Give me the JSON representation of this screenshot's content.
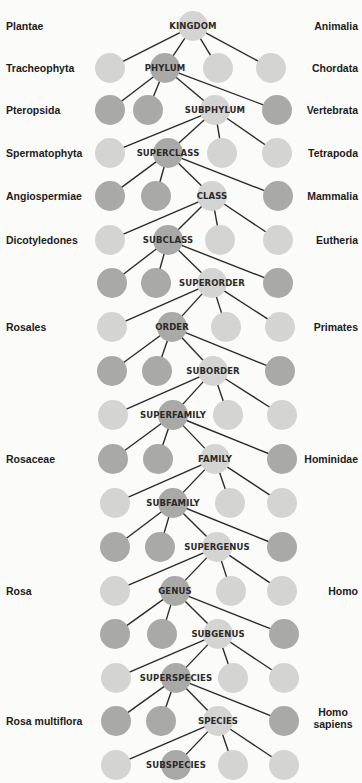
{
  "colors": {
    "background": "#fbfbf9",
    "light_node": "#d4d4d2",
    "dark_node": "#a9a9a7",
    "edge": "#2b2b2b",
    "text": "#1c1c1c"
  },
  "ranks": [
    {
      "label": "KINGDOM",
      "plant": "Plantae",
      "animal": "Animalia"
    },
    {
      "label": "PHYLUM",
      "plant": "Tracheophyta",
      "animal": "Chordata"
    },
    {
      "label": "SUBPHYLUM",
      "plant": "Pteropsida",
      "animal": "Vertebrata"
    },
    {
      "label": "SUPERCLASS",
      "plant": "Spermatophyta",
      "animal": "Tetrapoda"
    },
    {
      "label": "CLASS",
      "plant": "Angiospermiae",
      "animal": "Mammalia"
    },
    {
      "label": "SUBCLASS",
      "plant": "Dicotyledones",
      "animal": "Eutheria"
    },
    {
      "label": "SUPERORDER",
      "plant": "",
      "animal": ""
    },
    {
      "label": "ORDER",
      "plant": "Rosales",
      "animal": "Primates"
    },
    {
      "label": "SUBORDER",
      "plant": "",
      "animal": ""
    },
    {
      "label": "SUPERFAMILY",
      "plant": "",
      "animal": ""
    },
    {
      "label": "FAMILY",
      "plant": "Rosaceae",
      "animal": "Hominidae"
    },
    {
      "label": "SUBFAMILY",
      "plant": "",
      "animal": ""
    },
    {
      "label": "SUPERGENUS",
      "plant": "",
      "animal": ""
    },
    {
      "label": "GENUS",
      "plant": "Rosa",
      "animal": "Homo"
    },
    {
      "label": "SUBGENUS",
      "plant": "",
      "animal": ""
    },
    {
      "label": "SUPERSPECIES",
      "plant": "",
      "animal": ""
    },
    {
      "label": "SPECIES",
      "plant": "Rosa multiflora",
      "animal": "Homo sapiens"
    },
    {
      "label": "SUBSPECIES",
      "plant": "",
      "animal": ""
    }
  ],
  "rows": [
    {
      "y": 26,
      "nodes": [
        {
          "x": 193,
          "shade": "light",
          "rank": true
        }
      ]
    },
    {
      "y": 68,
      "nodes": [
        {
          "x": 110,
          "shade": "light"
        },
        {
          "x": 165,
          "shade": "dark",
          "rank": true
        },
        {
          "x": 218,
          "shade": "light"
        },
        {
          "x": 271,
          "shade": "light"
        }
      ]
    },
    {
      "y": 110,
      "nodes": [
        {
          "x": 110,
          "shade": "dark"
        },
        {
          "x": 148,
          "shade": "dark"
        },
        {
          "x": 215,
          "shade": "light",
          "rank": true
        },
        {
          "x": 277,
          "shade": "dark"
        }
      ]
    },
    {
      "y": 153,
      "nodes": [
        {
          "x": 110,
          "shade": "light"
        },
        {
          "x": 168,
          "shade": "dark",
          "rank": true
        },
        {
          "x": 222,
          "shade": "light"
        },
        {
          "x": 277,
          "shade": "light"
        }
      ]
    },
    {
      "y": 196,
      "nodes": [
        {
          "x": 110,
          "shade": "dark"
        },
        {
          "x": 156,
          "shade": "dark"
        },
        {
          "x": 212,
          "shade": "light",
          "rank": true
        },
        {
          "x": 278,
          "shade": "dark"
        }
      ]
    },
    {
      "y": 240,
      "nodes": [
        {
          "x": 110,
          "shade": "light"
        },
        {
          "x": 168,
          "shade": "dark",
          "rank": true
        },
        {
          "x": 220,
          "shade": "light"
        },
        {
          "x": 278,
          "shade": "light"
        }
      ]
    },
    {
      "y": 283,
      "nodes": [
        {
          "x": 112,
          "shade": "dark"
        },
        {
          "x": 156,
          "shade": "dark"
        },
        {
          "x": 212,
          "shade": "light",
          "rank": true
        },
        {
          "x": 278,
          "shade": "dark"
        }
      ]
    },
    {
      "y": 327,
      "nodes": [
        {
          "x": 112,
          "shade": "light"
        },
        {
          "x": 172,
          "shade": "dark",
          "rank": true
        },
        {
          "x": 226,
          "shade": "light"
        },
        {
          "x": 280,
          "shade": "light"
        }
      ]
    },
    {
      "y": 371,
      "nodes": [
        {
          "x": 112,
          "shade": "dark"
        },
        {
          "x": 157,
          "shade": "dark"
        },
        {
          "x": 213,
          "shade": "light",
          "rank": true
        },
        {
          "x": 280,
          "shade": "dark"
        }
      ]
    },
    {
      "y": 415,
      "nodes": [
        {
          "x": 113,
          "shade": "light"
        },
        {
          "x": 173,
          "shade": "dark",
          "rank": true
        },
        {
          "x": 228,
          "shade": "light"
        },
        {
          "x": 282,
          "shade": "light"
        }
      ]
    },
    {
      "y": 459,
      "nodes": [
        {
          "x": 113,
          "shade": "dark"
        },
        {
          "x": 158,
          "shade": "dark"
        },
        {
          "x": 215,
          "shade": "light",
          "rank": true
        },
        {
          "x": 282,
          "shade": "dark"
        }
      ]
    },
    {
      "y": 503,
      "nodes": [
        {
          "x": 115,
          "shade": "light"
        },
        {
          "x": 173,
          "shade": "dark",
          "rank": true
        },
        {
          "x": 230,
          "shade": "light"
        },
        {
          "x": 282,
          "shade": "light"
        }
      ]
    },
    {
      "y": 547,
      "nodes": [
        {
          "x": 115,
          "shade": "dark"
        },
        {
          "x": 160,
          "shade": "dark"
        },
        {
          "x": 217,
          "shade": "light",
          "rank": true
        },
        {
          "x": 282,
          "shade": "dark"
        }
      ]
    },
    {
      "y": 591,
      "nodes": [
        {
          "x": 115,
          "shade": "light"
        },
        {
          "x": 175,
          "shade": "dark",
          "rank": true
        },
        {
          "x": 231,
          "shade": "light"
        },
        {
          "x": 282,
          "shade": "light"
        }
      ]
    },
    {
      "y": 634,
      "nodes": [
        {
          "x": 115,
          "shade": "dark"
        },
        {
          "x": 162,
          "shade": "dark"
        },
        {
          "x": 218,
          "shade": "light",
          "rank": true
        },
        {
          "x": 284,
          "shade": "dark"
        }
      ]
    },
    {
      "y": 678,
      "nodes": [
        {
          "x": 116,
          "shade": "light"
        },
        {
          "x": 176,
          "shade": "dark",
          "rank": true
        },
        {
          "x": 233,
          "shade": "light"
        },
        {
          "x": 284,
          "shade": "light"
        }
      ]
    },
    {
      "y": 721,
      "nodes": [
        {
          "x": 116,
          "shade": "dark"
        },
        {
          "x": 161,
          "shade": "dark"
        },
        {
          "x": 218,
          "shade": "light",
          "rank": true
        },
        {
          "x": 284,
          "shade": "dark"
        }
      ]
    },
    {
      "y": 765,
      "nodes": [
        {
          "x": 116,
          "shade": "light"
        },
        {
          "x": 176,
          "shade": "dark",
          "rank": true
        },
        {
          "x": 233,
          "shade": "light"
        },
        {
          "x": 284,
          "shade": "light"
        }
      ]
    }
  ],
  "label_rows": [
    {
      "rank_index": 0,
      "y": 26
    },
    {
      "rank_index": 1,
      "y": 68
    },
    {
      "rank_index": 2,
      "y": 110
    },
    {
      "rank_index": 3,
      "y": 153
    },
    {
      "rank_index": 4,
      "y": 196
    },
    {
      "rank_index": 5,
      "y": 240
    },
    {
      "rank_index": 7,
      "y": 327
    },
    {
      "rank_index": 10,
      "y": 459
    },
    {
      "rank_index": 13,
      "y": 591
    },
    {
      "rank_index": 16,
      "y": 721
    }
  ],
  "node_radius": 15
}
